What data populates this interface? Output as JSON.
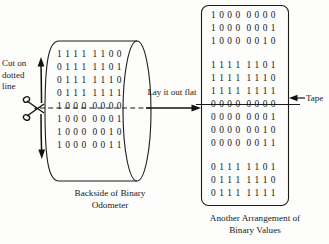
{
  "figure": {
    "title_left": "Backside of Binary\nOdometer",
    "title_right": "Another Arrangement of\nBinary Values"
  },
  "annotations": {
    "cut_label": "Cut on\ndotted\nline",
    "layout_label": "Lay it out\nflat",
    "tape_label": "Tape"
  },
  "cylinder": {
    "rows_above_cut": [
      "1 1 1 1  1 1 0 0",
      "0 1 1 1  1 1 0 1",
      "0 1 1 1  1 1 1 0",
      "0 1 1 1  1 1 1 1"
    ],
    "rows_below_cut": [
      "1 0 0 0  0 0 0 0",
      "1 0 0 0  0 0 0 1",
      "1 0 0 0  0 0 1 0",
      "1 0 0 0  0 0 1 1"
    ]
  },
  "rectangle": {
    "group_1": [
      "1 0 0 0  0 0 0 0",
      "1 0 0 0  0 0 0 1",
      "1 0 0 0  0 0 1 0"
    ],
    "group_2": [
      "1 1 1 1  1 1 0 1",
      "1 1 1 1  1 1 1 0",
      "1 1 1 1  1 1 1 1"
    ],
    "group_3": [
      "0 0 0 0  0 0 0 0",
      "0 0 0 0  0 0 0 1",
      "0 0 0 0  0 0 1 0",
      "0 0 0 0  0 0 1 1"
    ],
    "group_4": [
      "0 1 1 1  1 1 0 1",
      "0 1 1 1  1 1 1 0",
      "0 1 1 1  1 1 1 1"
    ]
  },
  "icons": {
    "scissors": "scissors-icon",
    "arrow_up": "arrow-up-icon",
    "arrow_down": "arrow-down-icon",
    "arrow_right": "arrow-right-icon",
    "arrow_left": "arrow-left-icon"
  },
  "colors": {
    "ink": "#161616",
    "paper": "#fdfdfb"
  }
}
